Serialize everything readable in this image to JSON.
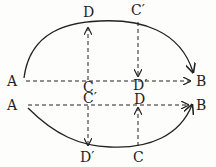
{
  "labels": {
    "A_top": "A",
    "B_top": "B",
    "A_bottom": "A",
    "B_bottom": "B",
    "D_top": "D",
    "Cp_top": "C′",
    "C_mid_upper": "C",
    "Dp_mid_upper": "D′",
    "Cp_mid_lower": "C′",
    "D_mid_lower": "D",
    "Dp_bottom": "D′",
    "C_bottom": "C"
  },
  "colors": {
    "ink": "#222222",
    "background": "#fdfdfb"
  }
}
